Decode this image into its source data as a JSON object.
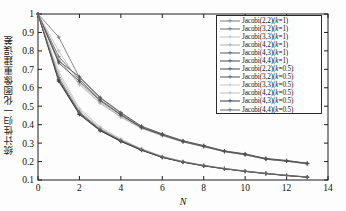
{
  "chart_data": {
    "type": "line",
    "title": "",
    "xlabel": "N",
    "ylabel": "统计性归一化图像重建误差",
    "xlim": [
      0,
      14
    ],
    "ylim": [
      0.1,
      1
    ],
    "xticks": [
      "0",
      "2",
      "4",
      "6",
      "8",
      "10",
      "12",
      "14"
    ],
    "yticks": [
      "0.1",
      "0.2",
      "0.3",
      "0.4",
      "0.5",
      "0.6",
      "0.7",
      "0.8",
      "0.9",
      "1"
    ],
    "grid": false,
    "legend_position": "upper right",
    "x": [
      0,
      1,
      2,
      3,
      4,
      5,
      6,
      7,
      8,
      9,
      10,
      11,
      12,
      13
    ],
    "series": [
      {
        "name": "Jacobi(2,2)(k=1)",
        "color": "#7b7b7b",
        "marker": "+",
        "values": [
          1.0,
          0.875,
          0.655,
          0.545,
          0.462,
          0.388,
          0.348,
          0.311,
          0.285,
          0.256,
          0.24,
          0.215,
          0.205,
          0.19
        ]
      },
      {
        "name": "Jacobi(3,2)(k=1)",
        "color": "#6e6e6e",
        "marker": "+",
        "values": [
          1.0,
          0.77,
          0.645,
          0.535,
          0.455,
          0.385,
          0.345,
          0.309,
          0.283,
          0.255,
          0.238,
          0.214,
          0.203,
          0.189
        ]
      },
      {
        "name": "Jacobi(3,3)(k=1)",
        "color": "#c2c2c2",
        "marker": "+",
        "values": [
          1.0,
          0.8,
          0.628,
          0.522,
          0.445,
          0.381,
          0.342,
          0.307,
          0.281,
          0.254,
          0.237,
          0.213,
          0.202,
          0.188
        ]
      },
      {
        "name": "Jacobi(4,2)(k=1)",
        "color": "#b0b0b0",
        "marker": "+",
        "values": [
          1.0,
          0.755,
          0.618,
          0.516,
          0.441,
          0.379,
          0.34,
          0.306,
          0.28,
          0.253,
          0.236,
          0.212,
          0.201,
          0.187
        ]
      },
      {
        "name": "Jacobi(4,3)(k=1)",
        "color": "#5a5a5a",
        "marker": "+",
        "values": [
          1.0,
          0.745,
          0.66,
          0.548,
          0.466,
          0.392,
          0.35,
          0.313,
          0.287,
          0.258,
          0.242,
          0.217,
          0.206,
          0.191
        ]
      },
      {
        "name": "Jacobi(4,4)(k=1)",
        "color": "#4d4d4d",
        "marker": "+",
        "values": [
          1.0,
          0.735,
          0.635,
          0.53,
          0.452,
          0.384,
          0.344,
          0.308,
          0.282,
          0.2545,
          0.2375,
          0.2135,
          0.2025,
          0.1885
        ]
      },
      {
        "name": "Jacobi(2,2)(k=0.5)",
        "color": "#4a4a4a",
        "marker": "+",
        "values": [
          1.0,
          0.645,
          0.462,
          0.372,
          0.312,
          0.264,
          0.224,
          0.198,
          0.178,
          0.162,
          0.148,
          0.136,
          0.125,
          0.116
        ]
      },
      {
        "name": "Jacobi(3,2)(k=0.5)",
        "color": "#555555",
        "marker": "+",
        "values": [
          1.0,
          0.64,
          0.458,
          0.369,
          0.31,
          0.262,
          0.223,
          0.197,
          0.177,
          0.161,
          0.147,
          0.135,
          0.1245,
          0.1155
        ]
      },
      {
        "name": "Jacobi(3,3)(k=0.5)",
        "color": "#c8c8c8",
        "marker": "+",
        "values": [
          1.0,
          0.688,
          0.488,
          0.388,
          0.322,
          0.27,
          0.229,
          0.201,
          0.18,
          0.163,
          0.149,
          0.137,
          0.126,
          0.117
        ]
      },
      {
        "name": "Jacobi(4,2)(k=0.5)",
        "color": "#bdbdbd",
        "marker": "+",
        "values": [
          1.0,
          0.672,
          0.478,
          0.382,
          0.318,
          0.268,
          0.227,
          0.2,
          0.179,
          0.1625,
          0.1485,
          0.1365,
          0.1255,
          0.1165
        ]
      },
      {
        "name": "Jacobi(4,3)(k=0.5)",
        "color": "#3d3d3d",
        "marker": "+",
        "values": [
          1.0,
          0.635,
          0.455,
          0.367,
          0.309,
          0.261,
          0.222,
          0.1965,
          0.1765,
          0.1605,
          0.1465,
          0.1345,
          0.124,
          0.115
        ]
      },
      {
        "name": "Jacobi(4,4)(k=0.5)",
        "color": "#666666",
        "marker": "+",
        "values": [
          1.0,
          0.655,
          0.468,
          0.375,
          0.315,
          0.266,
          0.2255,
          0.199,
          0.1785,
          0.1615,
          0.1475,
          0.1355,
          0.1248,
          0.1158
        ]
      }
    ]
  },
  "axes": {
    "x_title": "N",
    "y_title": "统计性归一化图像重建误差"
  }
}
